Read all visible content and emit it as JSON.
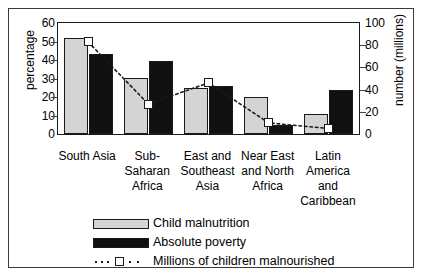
{
  "chart_data": {
    "type": "bar",
    "title": "",
    "categories": [
      "South Asia",
      "Sub-\nSaharan\nAfrica",
      "East and\nSoutheast\nAsia",
      "Near East\nand North\nAfrica",
      "Latin\nAmerica\nand\nCaribbean"
    ],
    "series": [
      {
        "name": "Child malnutrition",
        "type": "bar",
        "axis": "left",
        "color": "#d4d4d4",
        "values": [
          52,
          30,
          25,
          20,
          11
        ]
      },
      {
        "name": "Absolute poverty",
        "type": "bar",
        "axis": "left",
        "color": "#101010",
        "values": [
          43,
          39.5,
          26,
          5,
          24
        ]
      },
      {
        "name": "Millions of children malnourished",
        "type": "line",
        "axis": "right",
        "color": "#1a1a1a",
        "marker": "open-square",
        "linestyle": "dotted",
        "values": [
          83,
          27,
          46,
          10,
          5
        ]
      }
    ],
    "ylabel": "percentage",
    "ylim": [
      0,
      60
    ],
    "yticks": [
      0,
      10,
      20,
      30,
      40,
      50,
      60
    ],
    "y2label": "number (millions)",
    "y2lim": [
      0,
      100
    ],
    "y2ticks": [
      0,
      20,
      40,
      60,
      80,
      100
    ],
    "xlabel": "",
    "grid": false,
    "legend_position": "bottom"
  },
  "legend": {
    "items": [
      {
        "label": "Child malnutrition",
        "swatch": "light"
      },
      {
        "label": "Absolute poverty",
        "swatch": "dark"
      },
      {
        "label": "Millions of children malnourished",
        "swatch": "line-marker"
      }
    ]
  }
}
